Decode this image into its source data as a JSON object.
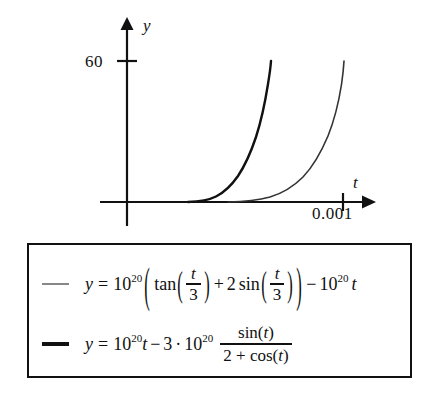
{
  "figure": {
    "background_color": "#ffffff",
    "ink_color": "#111111"
  },
  "plot": {
    "y_axis_label": "y",
    "x_axis_label": "t",
    "y_tick_label": "60",
    "x_tick_label": "0.001"
  },
  "legend": {
    "border_color": "#111111",
    "entries": [
      {
        "swatch": "thin-gray-line",
        "swatch_color": "#888888",
        "equation_text": "y = 10^20 ( tan(t/3) + 2 sin(t/3) ) - 10^20 t",
        "parts": {
          "y": "y",
          "eq": "=",
          "base": "10",
          "exp": "20",
          "open_big": "(",
          "tan": "tan",
          "open1": "(",
          "num1": "t",
          "den1": "3",
          "close1": ")",
          "plus": "+",
          "two": "2",
          "sin": "sin",
          "open2": "(",
          "num2": "t",
          "den2": "3",
          "close2": ")",
          "close_big": ")",
          "minus": "−",
          "base2": "10",
          "exp2": "20",
          "t": "t"
        }
      },
      {
        "swatch": "thick-black-line",
        "swatch_color": "#111111",
        "equation_text": "y = 10^20 t - 3 · 10^20 sin(t)/(2 + cos(t))",
        "parts": {
          "y": "y",
          "eq": "=",
          "base": "10",
          "exp": "20",
          "t": "t",
          "minus": "−",
          "three": "3",
          "dot": "·",
          "base2": "10",
          "exp2": "20",
          "num": "sin(t)",
          "den": "2 + cos(t)"
        }
      }
    ]
  },
  "chart_data": {
    "type": "line",
    "title": "",
    "xlabel": "t",
    "ylabel": "y",
    "xlim": [
      -0.00012,
      0.00133
    ],
    "ylim": [
      -14,
      76
    ],
    "grid": false,
    "legend_position": "below-plot-boxed",
    "xticks": [
      0.001
    ],
    "xticklabels": [
      "0.001"
    ],
    "yticks": [
      60
    ],
    "yticklabels": [
      "60"
    ],
    "series": [
      {
        "name": "y = 10^20 ( tan(t/3) + 2 sin(t/3) ) - 10^20 t",
        "color": "#333333",
        "linewidth": 1.4,
        "note": "rightmost curve; rises from ~0 near t=0.00057 to 60 at t=0.00113",
        "points": [
          [
            0.0005,
            0.0
          ],
          [
            0.00056,
            0.2
          ],
          [
            0.0006,
            0.4
          ],
          [
            0.00064,
            0.8
          ],
          [
            0.00068,
            1.4
          ],
          [
            0.00072,
            2.2
          ],
          [
            0.00076,
            3.2
          ],
          [
            0.0008,
            4.6
          ],
          [
            0.00084,
            6.4
          ],
          [
            0.00088,
            8.8
          ],
          [
            0.00092,
            12.0
          ],
          [
            0.00096,
            16.2
          ],
          [
            0.001,
            21.5
          ],
          [
            0.00104,
            29.0
          ],
          [
            0.00108,
            39.5
          ],
          [
            0.00111,
            50.0
          ],
          [
            0.00113,
            60.0
          ]
        ]
      },
      {
        "name": "y = 10^20 t - 3 * 10^20 sin(t)/(2 + cos(t))",
        "color": "#111111",
        "linewidth": 2.2,
        "note": "leftmost curve; rises from ~0 near t=0.00028 to 60 at t=0.00076",
        "points": [
          [
            0.00024,
            0.0
          ],
          [
            0.00028,
            0.2
          ],
          [
            0.00032,
            0.5
          ],
          [
            0.00036,
            1.0
          ],
          [
            0.0004,
            1.8
          ],
          [
            0.00044,
            2.8
          ],
          [
            0.00048,
            4.2
          ],
          [
            0.00052,
            6.2
          ],
          [
            0.00056,
            8.8
          ],
          [
            0.0006,
            12.5
          ],
          [
            0.00064,
            17.5
          ],
          [
            0.00068,
            24.5
          ],
          [
            0.00071,
            32.0
          ],
          [
            0.00073,
            40.0
          ],
          [
            0.00075,
            50.0
          ],
          [
            0.00076,
            60.0
          ]
        ]
      }
    ]
  }
}
